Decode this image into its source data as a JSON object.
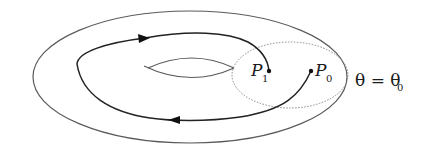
{
  "figure": {
    "type": "torus-poincare-section",
    "labels": {
      "p1": {
        "main": "P",
        "sub": "1"
      },
      "p0": {
        "main": "P",
        "sub": "0"
      },
      "section": {
        "lhs": "θ",
        "eq": " = ",
        "rhs": "θ",
        "sub": "0"
      }
    },
    "colors": {
      "stroke": "#5a5a5a",
      "trajectory": "#222222",
      "dotted": "#8a8a8a",
      "text": "#1a1a1a"
    }
  }
}
